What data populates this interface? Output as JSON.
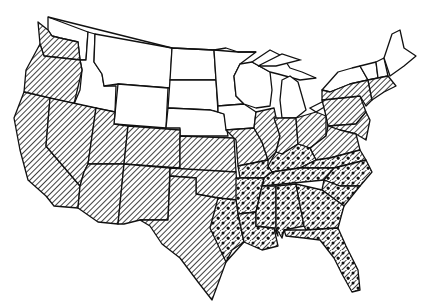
{
  "map": {
    "subject": "Contiguous United States",
    "style": "black-and-white line art",
    "legend_visible": false,
    "colors": {
      "background": "#ffffff",
      "ink": "#111111"
    },
    "categories": [
      {
        "id": "none",
        "pattern": "unshaded"
      },
      {
        "id": "hatched",
        "pattern": "diagonal-hatch"
      },
      {
        "id": "hatched-dotted",
        "pattern": "diagonal-hatch-with-dots"
      }
    ],
    "states": {
      "unshaded": [
        "WA-east",
        "ID",
        "MT",
        "WY",
        "ND",
        "SD",
        "NE",
        "MN",
        "WI",
        "MI",
        "IA",
        "NY-north",
        "VT",
        "NH",
        "ME"
      ],
      "hatched": [
        "WA-west",
        "OR",
        "CA",
        "NV",
        "UT",
        "AZ",
        "CO",
        "NM",
        "KS",
        "OK",
        "TX-west",
        "MO-north",
        "IL",
        "IN",
        "OH",
        "PA",
        "NY-south",
        "MA",
        "CT",
        "RI",
        "NJ",
        "DE",
        "MD",
        "WV",
        "VA-north"
      ],
      "hatched_dotted": [
        "TX-east",
        "AR",
        "LA",
        "MS",
        "AL",
        "GA",
        "FL",
        "SC",
        "NC",
        "TN",
        "KY",
        "VA-south",
        "MO-south"
      ]
    }
  }
}
